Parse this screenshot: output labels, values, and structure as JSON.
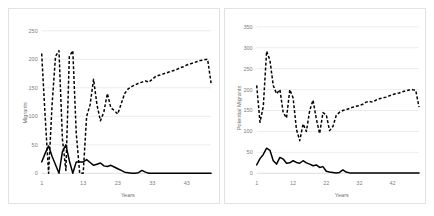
{
  "figure": {
    "background_color": "#ffffff",
    "panel_border_color": "#e2e2e2",
    "series_color": "#000000",
    "gridline_color": "#d9d9d9",
    "tick_label_color": "#808080"
  },
  "chart_data": [
    {
      "id": "left-chart",
      "type": "line",
      "title": "",
      "xlabel": "Years",
      "ylabel": "Migrants",
      "xlim": [
        1,
        50
      ],
      "ylim": [
        0,
        250
      ],
      "ytick_labels": [
        "0",
        "50",
        "100",
        "150",
        "200",
        "250"
      ],
      "ytick_values": [
        0,
        50,
        100,
        150,
        200,
        250
      ],
      "xtick_labels": [
        "1",
        "13",
        "23",
        "33",
        "43"
      ],
      "xtick_values": [
        1,
        13,
        23,
        33,
        43
      ],
      "grid": true,
      "legend": "none",
      "x": [
        1,
        2,
        3,
        4,
        5,
        6,
        7,
        8,
        9,
        10,
        11,
        12,
        13,
        14,
        15,
        16,
        17,
        18,
        19,
        20,
        21,
        22,
        23,
        24,
        25,
        26,
        27,
        28,
        29,
        30,
        31,
        32,
        33,
        34,
        35,
        36,
        37,
        38,
        39,
        40,
        41,
        42,
        43,
        44,
        45,
        46,
        47,
        48,
        49,
        50
      ],
      "series": [
        {
          "name": "potential-migrants-dashed",
          "style": "dashed",
          "values": [
            210,
            100,
            0,
            120,
            205,
            215,
            60,
            5,
            205,
            215,
            70,
            0,
            0,
            100,
            120,
            165,
            120,
            92,
            108,
            140,
            115,
            110,
            104,
            122,
            140,
            148,
            152,
            155,
            158,
            160,
            162,
            160,
            165,
            170,
            172,
            174,
            176,
            178,
            180,
            182,
            185,
            187,
            190,
            192,
            194,
            196,
            198,
            199,
            200,
            158
          ]
        },
        {
          "name": "migrants-solid",
          "style": "solid",
          "values": [
            20,
            35,
            48,
            30,
            15,
            0,
            38,
            50,
            22,
            0,
            20,
            20,
            20,
            24,
            19,
            14,
            16,
            18,
            13,
            12,
            14,
            11,
            8,
            5,
            2,
            1,
            0,
            0,
            1,
            5,
            2,
            0,
            0,
            0,
            0,
            0,
            0,
            0,
            0,
            0,
            0,
            0,
            0,
            0,
            0,
            0,
            0,
            0,
            0,
            0
          ]
        }
      ]
    },
    {
      "id": "right-chart",
      "type": "line",
      "title": "",
      "xlabel": "Years",
      "ylabel": "Potential Migrants",
      "xlim": [
        1,
        50
      ],
      "ylim": [
        0,
        350
      ],
      "ytick_labels": [
        "0",
        "50",
        "100",
        "150",
        "200",
        "250",
        "300",
        "350"
      ],
      "ytick_values": [
        0,
        50,
        100,
        150,
        200,
        250,
        300,
        350
      ],
      "xtick_labels": [
        "1",
        "12",
        "22",
        "32",
        "42"
      ],
      "xtick_values": [
        1,
        12,
        22,
        32,
        42
      ],
      "grid": true,
      "legend": "none",
      "x": [
        1,
        2,
        3,
        4,
        5,
        6,
        7,
        8,
        9,
        10,
        11,
        12,
        13,
        14,
        15,
        16,
        17,
        18,
        19,
        20,
        21,
        22,
        23,
        24,
        25,
        26,
        27,
        28,
        29,
        30,
        31,
        32,
        33,
        34,
        35,
        36,
        37,
        38,
        39,
        40,
        41,
        42,
        43,
        44,
        45,
        46,
        47,
        48,
        49,
        50
      ],
      "series": [
        {
          "name": "potential-migrants-dashed",
          "style": "dashed",
          "values": [
            210,
            122,
            160,
            292,
            270,
            210,
            190,
            200,
            145,
            132,
            200,
            180,
            105,
            78,
            118,
            100,
            150,
            175,
            130,
            95,
            145,
            140,
            102,
            112,
            138,
            146,
            150,
            152,
            155,
            158,
            160,
            162,
            165,
            170,
            172,
            170,
            175,
            178,
            180,
            182,
            185,
            188,
            190,
            192,
            195,
            197,
            199,
            200,
            198,
            158
          ]
        },
        {
          "name": "migrants-solid",
          "style": "solid",
          "values": [
            20,
            35,
            45,
            60,
            55,
            30,
            22,
            38,
            34,
            24,
            25,
            30,
            26,
            24,
            30,
            25,
            22,
            18,
            20,
            14,
            16,
            5,
            3,
            2,
            1,
            2,
            8,
            3,
            1,
            1,
            1,
            1,
            1,
            1,
            1,
            1,
            1,
            1,
            1,
            1,
            1,
            1,
            1,
            1,
            1,
            1,
            1,
            1,
            1,
            1
          ]
        }
      ]
    }
  ]
}
